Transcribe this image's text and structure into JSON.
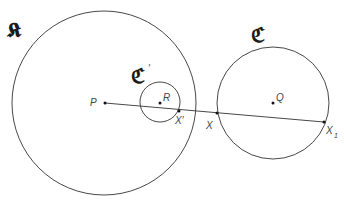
{
  "diagram": {
    "circles": {
      "K": {
        "label": "𝕶",
        "cx": 104,
        "cy": 103,
        "r": 92
      },
      "C_prime": {
        "label": "ℭ",
        "prime": "′",
        "cx": 160,
        "cy": 102,
        "r": 20
      },
      "C": {
        "label": "ℭ",
        "cx": 273,
        "cy": 103,
        "r": 56
      }
    },
    "points": {
      "P": {
        "label": "P",
        "x": 105,
        "y": 103
      },
      "R": {
        "label": "R",
        "x": 160,
        "y": 103
      },
      "Q": {
        "label": "Q",
        "x": 273,
        "y": 103
      },
      "X_prime": {
        "label": "X′",
        "x": 179,
        "y": 111
      },
      "X": {
        "label": "X",
        "x": 217,
        "y": 113
      },
      "X1": {
        "label": "X",
        "subscript": "1",
        "x": 324,
        "y": 122
      }
    },
    "line": {
      "from": "P",
      "to": "X1"
    },
    "colors": {
      "stroke": "#333333",
      "text": "#444444",
      "fraktur": "#1a1a1a"
    }
  }
}
